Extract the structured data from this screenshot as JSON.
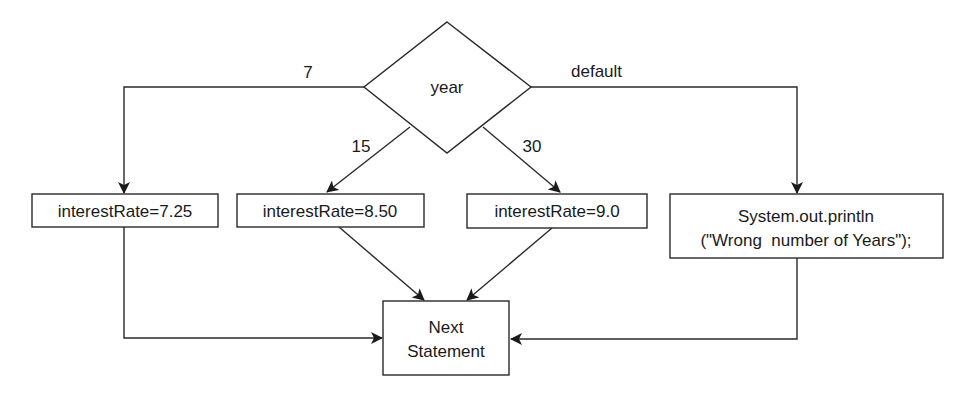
{
  "diagram": {
    "type": "flowchart",
    "decision": {
      "label": "year"
    },
    "edge_labels": {
      "case_7": "7",
      "case_15": "15",
      "case_30": "30",
      "default": "default"
    },
    "nodes": {
      "rate_7": {
        "label": "interestRate=7.25"
      },
      "rate_15": {
        "label": "interestRate=8.50"
      },
      "rate_30": {
        "label": "interestRate=9.0"
      },
      "default": {
        "line1": "System.out.println",
        "line2": "(\"Wrong  number of Years\");"
      },
      "next": {
        "line1": "Next",
        "line2": "Statement"
      }
    },
    "edges": [
      {
        "from": "year",
        "to": "rate_7",
        "label": "7"
      },
      {
        "from": "year",
        "to": "rate_15",
        "label": "15"
      },
      {
        "from": "year",
        "to": "rate_30",
        "label": "30"
      },
      {
        "from": "year",
        "to": "default",
        "label": "default"
      },
      {
        "from": "rate_7",
        "to": "next"
      },
      {
        "from": "rate_15",
        "to": "next"
      },
      {
        "from": "rate_30",
        "to": "next"
      },
      {
        "from": "default",
        "to": "next"
      }
    ]
  }
}
